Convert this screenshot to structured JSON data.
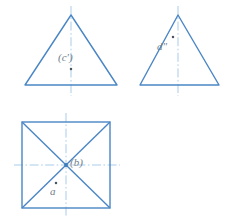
{
  "drawing": {
    "title": "Orthographic projection of a pyramid: three views",
    "background_color": "#ffffff",
    "outline_color": "#4a86c5",
    "centerline_color": "#9fc6e6",
    "point_color": "#4a5560",
    "label_color": "#6f7e8c",
    "outline_width": 1.4,
    "centerline_width": 0.9,
    "views": [
      {
        "name": "front-view-triangle",
        "shape": "triangle",
        "apex": [
          71,
          15
        ],
        "base_left": [
          25,
          85
        ],
        "base_right": [
          117,
          85
        ],
        "centerline": {
          "x": 71,
          "y1": 6,
          "y2": 96
        },
        "point": {
          "x": 71,
          "y": 69
        },
        "label": "(c')"
      },
      {
        "name": "side-view-triangle",
        "shape": "triangle",
        "apex": [
          178,
          15
        ],
        "base_left": [
          140,
          85
        ],
        "base_right": [
          219,
          85
        ],
        "centerline": {
          "x": 178,
          "y1": 6,
          "y2": 96
        },
        "point": {
          "x": 173,
          "y": 37
        },
        "label": "d″"
      },
      {
        "name": "top-view-square",
        "shape": "square-with-diagonals",
        "top_left": [
          22,
          122
        ],
        "top_right": [
          110,
          122
        ],
        "bottom_right": [
          110,
          208
        ],
        "bottom_left": [
          22,
          208
        ],
        "vertical_centerline": {
          "x": 66,
          "y1": 113,
          "y2": 217
        },
        "horizontal_centerline": {
          "y": 165,
          "x1": 14,
          "x2": 120
        },
        "center_point": {
          "x": 66,
          "y": 165
        },
        "center_label": "(b)",
        "lower_point": {
          "x": 56,
          "y": 183
        },
        "lower_label": "a"
      }
    ],
    "labels": {
      "c_prime": "(c')",
      "d_double_prime": "d″",
      "b_paren": "(b)",
      "a": "a"
    }
  }
}
